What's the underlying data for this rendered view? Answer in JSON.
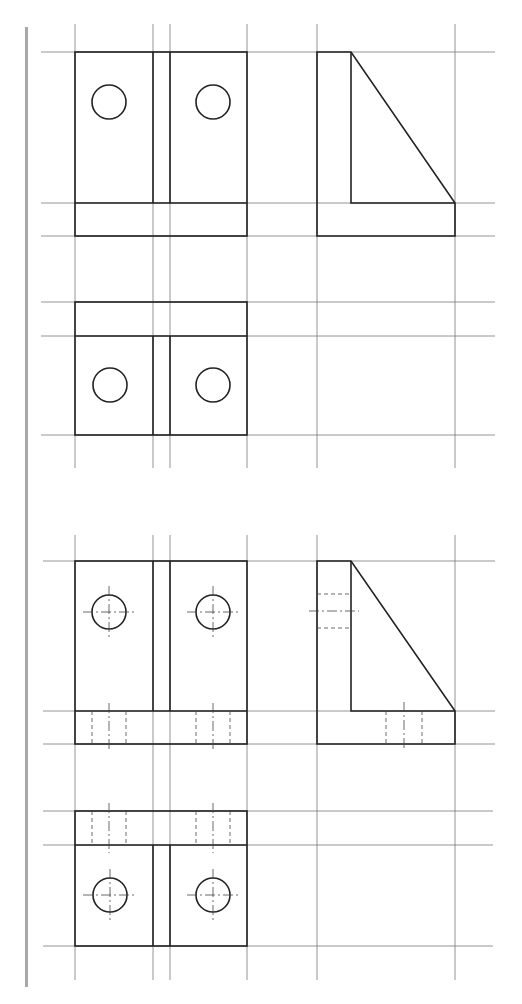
{
  "drawing": {
    "title": "Orthographic views of bracket with two holes",
    "description": "Two sets of projections (front, side, top) of an L-bracket with a triangular rib and two circular holes; lower set adds hidden lines and centerlines.",
    "colors": {
      "line": "#222222",
      "grid": "#7a7a7a",
      "margin_bar": "#a8a8a8",
      "background": "#ffffff"
    },
    "sets": [
      {
        "label": "Set 1 — visible edges only",
        "views": [
          "front-view",
          "side-view",
          "top-view"
        ],
        "hidden_lines": false,
        "centerlines": false
      },
      {
        "label": "Set 2 — with hidden lines and centerlines",
        "views": [
          "front-view",
          "side-view",
          "top-view"
        ],
        "hidden_lines": true,
        "centerlines": true
      }
    ],
    "holes_per_view": 2
  }
}
